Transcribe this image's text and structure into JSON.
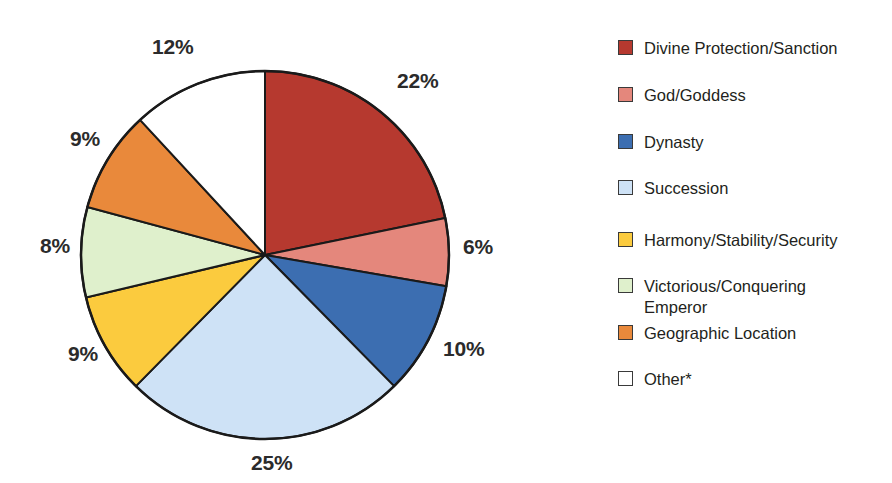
{
  "chart_data": {
    "type": "pie",
    "title": "",
    "subtitle": "",
    "xlabel": "",
    "ylabel": "",
    "legend_position": "right",
    "grid": false,
    "value_unit": "%",
    "categories": [
      "Divine Protection/Sanction",
      "God/Goddess",
      "Dynasty",
      "Succession",
      "Harmony/Stability/Security",
      "Victorious/Conquering Emperor",
      "Geographic Location",
      "Other*"
    ],
    "values": [
      22,
      6,
      10,
      25,
      9,
      8,
      9,
      12
    ],
    "data_labels": [
      "22%",
      "6%",
      "10%",
      "25%",
      "9%",
      "8%",
      "9%",
      "12%"
    ],
    "colors": [
      "#B6392F",
      "#E4877C",
      "#3C6EB1",
      "#CEE2F6",
      "#FBCB3E",
      "#DFF0CC",
      "#E9893B",
      "#FFFFFF"
    ],
    "slice_border_color": "#1a1a1a",
    "start_angle_deg": 0,
    "direction": "clockwise"
  },
  "pie": {
    "labels": [
      {
        "text": "22%",
        "left": 397,
        "top": 70
      },
      {
        "text": "6%",
        "left": 463,
        "top": 236
      },
      {
        "text": "10%",
        "left": 443,
        "top": 338
      },
      {
        "text": "25%",
        "left": 251,
        "top": 452
      },
      {
        "text": "9%",
        "left": 68,
        "top": 343
      },
      {
        "text": "8%",
        "left": 40,
        "top": 235
      },
      {
        "text": "9%",
        "left": 70,
        "top": 128
      },
      {
        "text": "12%",
        "left": 152,
        "top": 36
      }
    ]
  },
  "legend": {
    "items": [
      {
        "label": "Divine Protection/Sanction",
        "color": "#B6392F",
        "top": 10
      },
      {
        "label": "God/Goddess",
        "color": "#E4877C",
        "top": 57
      },
      {
        "label": "Dynasty",
        "color": "#3C6EB1",
        "top": 104
      },
      {
        "label": "Succession",
        "color": "#CEE2F6",
        "top": 150
      },
      {
        "label": "Harmony/Stability/Security",
        "color": "#FBCB3E",
        "top": 202
      },
      {
        "label": "Victorious/Conquering\nEmperor",
        "color": "#DFF0CC",
        "top": 248
      },
      {
        "label": "Geographic Location",
        "color": "#E9893B",
        "top": 295
      },
      {
        "label": "Other*",
        "color": "#FFFFFF",
        "top": 341
      }
    ]
  }
}
